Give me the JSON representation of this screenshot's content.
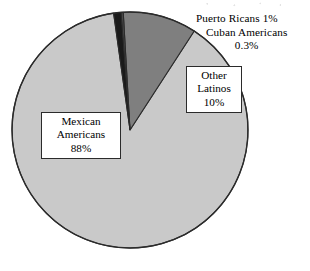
{
  "chart_data": {
    "type": "pie",
    "title": "",
    "subtitle": "",
    "xlabel": "",
    "ylabel": "",
    "legend_position": "none",
    "grid": false,
    "start_angle_deg": 352,
    "direction": "clockwise",
    "center": {
      "x": 130,
      "y": 130
    },
    "radius": 118,
    "categories": [
      "Puerto Ricans",
      "Cuban Americans",
      "Other Latinos",
      "Mexican Americans"
    ],
    "values": [
      1,
      0.3,
      10,
      88
    ],
    "value_labels": [
      "1%",
      "0.3%",
      "10%",
      "88%"
    ],
    "colors": [
      "#1a1a1a",
      "#4a4a4a",
      "#7f7f7f",
      "#c9c9c9"
    ],
    "slices": [
      {
        "name": "Puerto Ricans",
        "value": 1,
        "value_label": "1%",
        "color": "#1a1a1a",
        "label_style": "callout-outside"
      },
      {
        "name": "Cuban Americans",
        "value": 0.3,
        "value_label": "0.3%",
        "color": "#4a4a4a",
        "label_style": "callout-outside"
      },
      {
        "name": "Other Latinos",
        "value": 10,
        "value_label": "10%",
        "color": "#7f7f7f",
        "label_style": "boxed-inside"
      },
      {
        "name": "Mexican Americans",
        "value": 88,
        "value_label": "88%",
        "color": "#c9c9c9",
        "label_style": "boxed-inside"
      }
    ]
  },
  "labels": {
    "puerto_ricans": "Puerto Ricans 1%",
    "cuban_americans_line1": "Cuban Americans",
    "cuban_americans_line2": "0.3%",
    "other_latinos_line1": "Other",
    "other_latinos_line2": "Latinos",
    "other_latinos_line3": "10%",
    "mexican_americans_line1": "Mexican",
    "mexican_americans_line2": "Americans",
    "mexican_americans_line3": "88%"
  },
  "style": {
    "background": "#ffffff",
    "outline": "#2b2b2b",
    "text": "#000000"
  }
}
